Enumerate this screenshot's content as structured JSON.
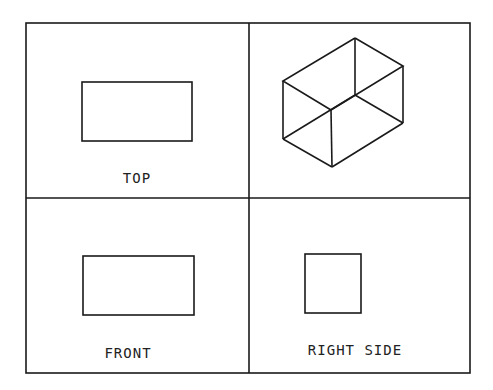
{
  "diagram": {
    "type": "orthographic-projection",
    "line_color": "#1a1a1a",
    "background": "#ffffff",
    "panels": [
      {
        "id": "top",
        "label": "TOP",
        "shape": "rectangle"
      },
      {
        "id": "isometric",
        "label": "",
        "shape": "isometric-box"
      },
      {
        "id": "front",
        "label": "FRONT",
        "shape": "rectangle"
      },
      {
        "id": "right-side",
        "label": "RIGHT SIDE",
        "shape": "square"
      }
    ]
  },
  "labels": {
    "top": "TOP",
    "front": "FRONT",
    "right_side": "RIGHT SIDE"
  }
}
